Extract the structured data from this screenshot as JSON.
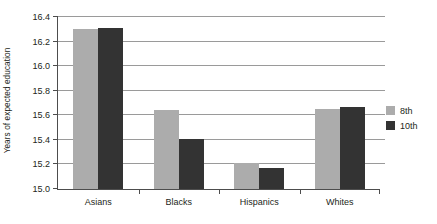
{
  "chart_data": {
    "type": "bar",
    "title": "",
    "xlabel": "",
    "ylabel": "Years of expected education",
    "ylim": [
      15.0,
      16.4
    ],
    "yticks": [
      "15.0",
      "15.2",
      "15.4",
      "15.6",
      "15.8",
      "16.0",
      "16.2",
      "16.4"
    ],
    "grid": true,
    "legend_position": "right",
    "categories": [
      "Asians",
      "Blacks",
      "Hispanics",
      "Whites"
    ],
    "series": [
      {
        "name": "8th",
        "color": "#acacac",
        "values": [
          16.3,
          15.64,
          15.21,
          15.655
        ]
      },
      {
        "name": "10th",
        "color": "#333333",
        "values": [
          16.31,
          15.41,
          15.17,
          15.67
        ]
      }
    ]
  }
}
